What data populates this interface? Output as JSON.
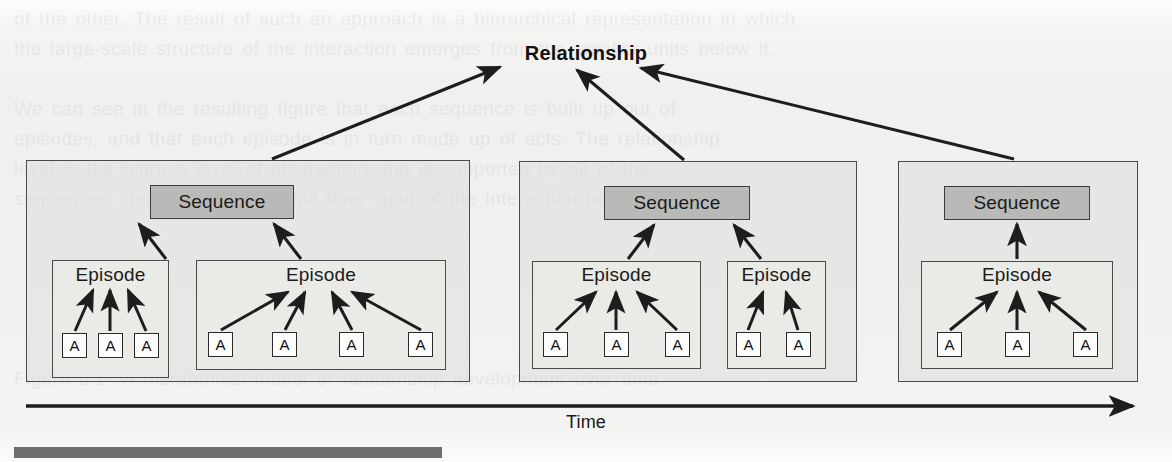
{
  "figure": {
    "root_label": "Relationship",
    "axis_label": "Time",
    "sequence_label": "Sequence",
    "episode_label": "Episode",
    "atom_label": "A",
    "colors": {
      "sequence_fill": "#b9b9b7",
      "group_fill": "#dedede",
      "episode_fill": "#ececea",
      "atom_fill": "#fcfcfc",
      "stroke": "#2a2a2a",
      "page_background": "#f1f1f0",
      "bottom_bar": "#6e6e6e"
    },
    "groups": [
      {
        "name": "sequence-group-1",
        "sequence": {
          "label": "Sequence"
        },
        "episodes": [
          {
            "label": "Episode",
            "atoms": [
              "A",
              "A",
              "A"
            ]
          },
          {
            "label": "Episode",
            "atoms": [
              "A",
              "A",
              "A",
              "A"
            ]
          }
        ]
      },
      {
        "name": "sequence-group-2",
        "sequence": {
          "label": "Sequence"
        },
        "episodes": [
          {
            "label": "Episode",
            "atoms": [
              "A",
              "A",
              "A"
            ]
          },
          {
            "label": "Episode",
            "atoms": [
              "A",
              "A"
            ]
          }
        ]
      },
      {
        "name": "sequence-group-3",
        "sequence": {
          "label": "Sequence"
        },
        "episodes": [
          {
            "label": "Episode",
            "atoms": [
              "A",
              "A",
              "A"
            ]
          }
        ]
      }
    ]
  },
  "ghost_text": {
    "line_1": "of the other. The result of such an approach is a hierarchical representation in which",
    "line_2": "the large-scale structure of the interaction emerges from the smaller units below it.",
    "line_3": "",
    "line_4": "We can see in the resulting figure that each sequence is built up out of",
    "line_5": "episodes, and that each episode is in turn made up of acts. The relationship",
    "line_6": "level is the highest level of abstraction and is supported by all of the",
    "line_7": "sequences observed over the full time span of the interaction being studied.",
    "line_8": "",
    "line_9": "",
    "line_10": "",
    "line_11": "",
    "line_12": "",
    "line_13": "Figure 3.1  A hierarchical model of relationship development over time."
  }
}
